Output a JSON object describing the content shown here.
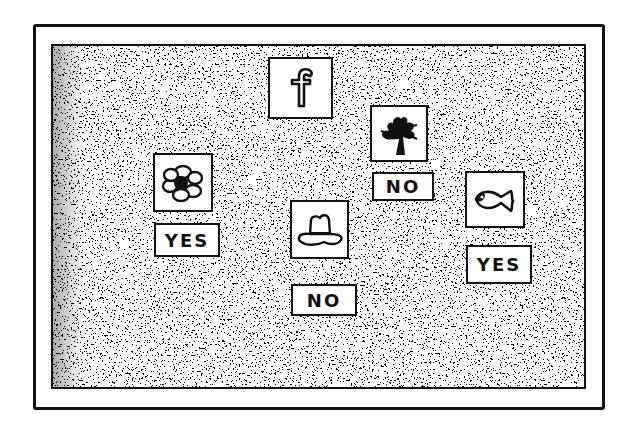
{
  "scene": {
    "description": "Hand-drawn stippled board with picture cards and yes/no answer tags",
    "colors": {
      "ink": "#111111",
      "paper": "#ffffff"
    }
  },
  "cards": [
    {
      "id": "letter-f",
      "icon": "letter-f-icon",
      "glyph": "f",
      "label": null
    },
    {
      "id": "tree",
      "icon": "tree-icon",
      "label": "NO"
    },
    {
      "id": "flower",
      "icon": "flower-icon",
      "label": "YES"
    },
    {
      "id": "hat",
      "icon": "hat-icon",
      "label": "NO"
    },
    {
      "id": "fish",
      "icon": "fish-icon",
      "label": "YES"
    }
  ]
}
